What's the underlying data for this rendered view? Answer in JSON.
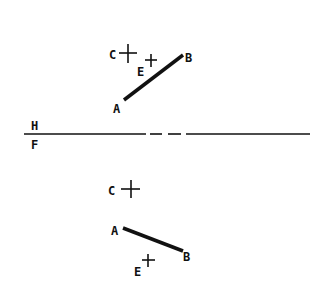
{
  "diagram": {
    "type": "descriptive-geometry-projection",
    "ground_line": {
      "upper_label": "H",
      "lower_label": "F"
    },
    "top_view": {
      "segment": {
        "start_label": "A",
        "end_label": "B"
      },
      "points": [
        {
          "label": "C",
          "marker": "plus"
        },
        {
          "label": "E",
          "marker": "plus"
        }
      ]
    },
    "front_view": {
      "segment": {
        "start_label": "A",
        "end_label": "B"
      },
      "points": [
        {
          "label": "C",
          "marker": "plus"
        },
        {
          "label": "E",
          "marker": "plus"
        }
      ]
    }
  }
}
